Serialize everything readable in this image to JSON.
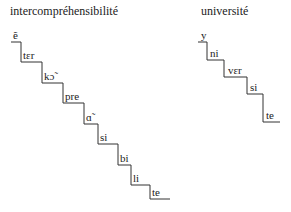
{
  "words": [
    {
      "title": "intercompréhensibilité",
      "syllables": [
        "ẽ",
        "tɛr",
        "kɔ̃",
        "pre",
        "ɑ̃",
        "si",
        "bi",
        "li",
        "te"
      ]
    },
    {
      "title": "université",
      "syllables": [
        "y",
        "ni",
        "vɛr",
        "si",
        "te"
      ]
    }
  ]
}
